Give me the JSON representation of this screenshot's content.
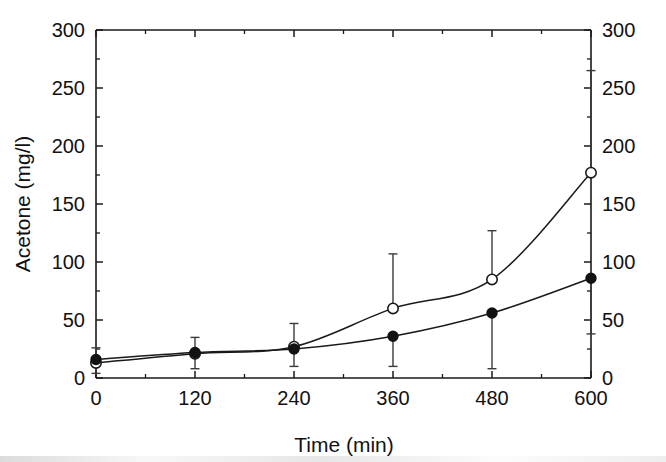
{
  "chart_data": {
    "type": "scatter",
    "title": "",
    "xlabel": "Time (min)",
    "ylabel": "Acetone (mg/l)",
    "ylabel_right": "Acetone (mg/l)",
    "xlim": [
      0,
      600
    ],
    "ylim": [
      0,
      300
    ],
    "x_ticks": [
      0,
      120,
      240,
      360,
      480,
      600
    ],
    "x_tick_labels": [
      "0",
      "120",
      "240",
      "360",
      "480",
      "600"
    ],
    "x_minor_interval": 60,
    "y_ticks": [
      0,
      50,
      100,
      150,
      200,
      250,
      300
    ],
    "y_tick_labels": [
      "0",
      "50",
      "100",
      "150",
      "200",
      "250",
      "300"
    ],
    "y_tick_labels_right": [
      "0",
      "50",
      "100",
      "150",
      "200",
      "250",
      "300"
    ],
    "y_minor_interval": 25,
    "grid": false,
    "legend": "none",
    "x": [
      0,
      120,
      240,
      360,
      480,
      600
    ],
    "series": [
      {
        "name": "open-circle-series",
        "marker": "open-circle",
        "values": [
          13,
          21,
          27,
          60,
          85,
          177
        ],
        "error_upper": [
          26,
          35,
          47,
          107,
          127,
          265
        ],
        "error_lower": [
          13,
          21,
          27,
          60,
          85,
          177
        ],
        "error_direction": "up",
        "fit_curve": "exponential"
      },
      {
        "name": "filled-circle-series",
        "marker": "filled-circle",
        "values": [
          16,
          22,
          25,
          36,
          56,
          86
        ],
        "error_upper": [
          16,
          22,
          25,
          36,
          56,
          86
        ],
        "error_lower": [
          4,
          8,
          10,
          10,
          8,
          38
        ],
        "error_direction": "down",
        "fit_curve": "exponential"
      }
    ],
    "colors": {
      "axis": "#1a1a1a",
      "curve": "#1a1a1a",
      "marker_open_fill": "#ffffff",
      "marker_filled_fill": "#121212",
      "error_bar": "#3a3a3a",
      "background": "#ffffff"
    }
  }
}
